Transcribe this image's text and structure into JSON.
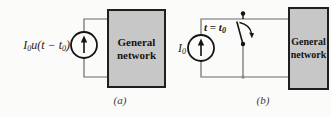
{
  "page": {
    "background": "#fbfbfa"
  },
  "colors": {
    "box_fill": "#c7c7c7",
    "box_border": "#1f1f1f",
    "wire": "#6b6b6b",
    "ink": "#141414",
    "caption": "#3a3a3a"
  },
  "figure_a": {
    "source_label": {
      "base": "I",
      "base_sub": "0",
      "mid": "u(t − t",
      "mid_sub": "0",
      "end": ")"
    },
    "box": {
      "line1": "General",
      "line2": "network"
    },
    "caption": "(a)"
  },
  "figure_b": {
    "source_label": {
      "base": "I",
      "base_sub": "0"
    },
    "switch_label": {
      "pre": "t = t",
      "sub": "0"
    },
    "box": {
      "line1": "General",
      "line2": "network"
    },
    "caption": "(b)"
  },
  "icons": {
    "figure_a_source": "current-source-up-arrow-icon",
    "figure_b_source": "current-source-up-arrow-icon",
    "figure_b_switch": "opening-switch-icon"
  }
}
